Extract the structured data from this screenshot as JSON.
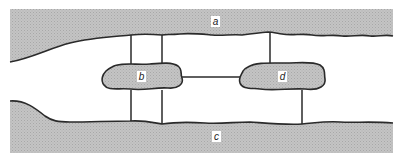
{
  "diagram": {
    "type": "schematic",
    "colors": {
      "band_fill": "#bdbdbd",
      "blob_fill": "#b5b5b5",
      "stroke": "#2a2a2a",
      "background": "#ffffff"
    },
    "regions": {
      "top_band": {
        "label": "a"
      },
      "bottom_band": {
        "label": "c"
      },
      "left_blob": {
        "label": "b"
      },
      "right_blob": {
        "label": "d"
      }
    },
    "connections": [
      {
        "from": "a",
        "to": "b",
        "count": 2
      },
      {
        "from": "b",
        "to": "c",
        "count": 2
      },
      {
        "from": "b",
        "to": "d",
        "count": 1
      },
      {
        "from": "a",
        "to": "d",
        "count": 1
      },
      {
        "from": "d",
        "to": "c",
        "count": 1
      }
    ]
  }
}
